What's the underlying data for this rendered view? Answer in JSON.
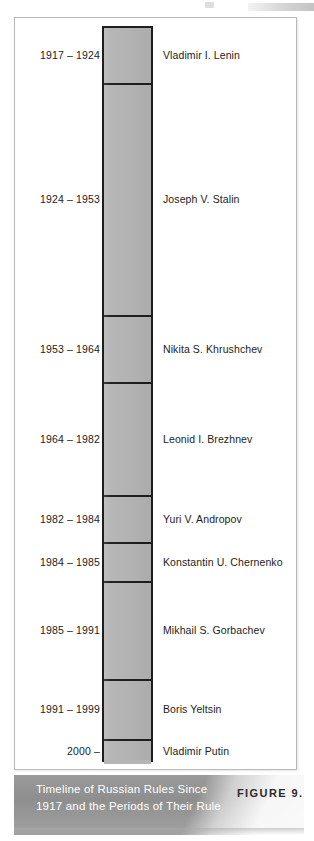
{
  "figure": {
    "caption": "Timeline of Russian Rules Since 1917 and the Periods of Their Rule",
    "figure_number": "FIGURE 9.1",
    "colors": {
      "bar_fill": "#b5b5b5",
      "bar_stroke": "#1e1e1e",
      "frame_border": "#b9b9b9",
      "caption_band": "#8e8e8e",
      "caption_text": "#ffffff",
      "figure_number_text": "#2a2a2a"
    }
  },
  "chart_data": {
    "type": "bar",
    "orientation": "vertical-stacked-timeline",
    "title": "Timeline of Russian Rules Since 1917 and the Periods of Their Rule",
    "xlabel": "",
    "ylabel": "",
    "categories": [
      "Vladimir I. Lenin",
      "Joseph V. Stalin",
      "Nikita S. Khrushchev",
      "Leonid I. Brezhnev",
      "Yuri V. Andropov",
      "Konstantin U. Chernenko",
      "Mikhail S. Gorbachev",
      "Boris Yeltsin",
      "Vladimir Putin"
    ],
    "values": [
      7,
      29,
      11,
      18,
      2,
      1,
      6,
      8,
      2
    ],
    "ylim": [
      1917,
      2002
    ],
    "grid": false,
    "legend": null,
    "segments": [
      {
        "period": "1917 – 1924",
        "name": "Vladimir I. Lenin",
        "start_year": 1917,
        "end_year": 1924,
        "years": 7,
        "top": 0,
        "height": 57
      },
      {
        "period": "1924 – 1953",
        "name": "Joseph V. Stalin",
        "start_year": 1924,
        "end_year": 1953,
        "years": 29,
        "top": 57,
        "height": 232
      },
      {
        "period": "1953 – 1964",
        "name": "Nikita S. Khrushchev",
        "start_year": 1953,
        "end_year": 1964,
        "years": 11,
        "top": 289,
        "height": 67
      },
      {
        "period": "1964 – 1982",
        "name": "Leonid I. Brezhnev",
        "start_year": 1964,
        "end_year": 1982,
        "years": 18,
        "top": 356,
        "height": 113
      },
      {
        "period": "1982 – 1984",
        "name": "Yuri V. Andropov",
        "start_year": 1982,
        "end_year": 1984,
        "years": 2,
        "top": 469,
        "height": 47
      },
      {
        "period": "1984 – 1985",
        "name": "Konstantin U. Chernenko",
        "start_year": 1984,
        "end_year": 1985,
        "years": 1,
        "top": 516,
        "height": 39
      },
      {
        "period": "1985 – 1991",
        "name": "Mikhail S. Gorbachev",
        "start_year": 1985,
        "end_year": 1991,
        "years": 6,
        "top": 555,
        "height": 98
      },
      {
        "period": "1991 – 1999",
        "name": "Boris Yeltsin",
        "start_year": 1991,
        "end_year": 1999,
        "years": 8,
        "top": 653,
        "height": 60
      },
      {
        "period": "2000 –",
        "name": "Vladimir Putin",
        "start_year": 2000,
        "end_year": null,
        "years": 2,
        "top": 713,
        "height": 23
      }
    ]
  }
}
